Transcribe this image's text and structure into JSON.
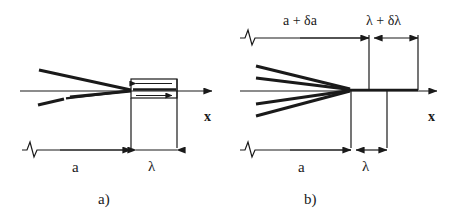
{
  "figure": {
    "background_color": "#ffffff",
    "ink_color": "#1a1a1a"
  },
  "panels": [
    {
      "id": "a",
      "caption": "a)",
      "axis_label": "x",
      "ray_count": 2,
      "has_box": true,
      "box_arrow_top_direction": "left",
      "box_arrow_bottom_direction": "right",
      "dimensions": [
        {
          "name": "distance-a",
          "label": "a",
          "position": "bottom"
        },
        {
          "name": "distance-lambda",
          "label": "λ",
          "position": "bottom"
        }
      ],
      "break_symbols": 1
    },
    {
      "id": "b",
      "caption": "b)",
      "axis_label": "x",
      "ray_count": 4,
      "has_box": false,
      "dimensions": [
        {
          "name": "distance-a-plus-delta-a",
          "label": "a + δa",
          "position": "top"
        },
        {
          "name": "distance-lambda-plus-delta-lambda",
          "label": "λ + δλ",
          "position": "top"
        },
        {
          "name": "distance-a",
          "label": "a",
          "position": "bottom"
        },
        {
          "name": "distance-lambda",
          "label": "λ",
          "position": "bottom"
        }
      ],
      "break_symbols": 2
    }
  ],
  "labels": {
    "panel_a_caption": "a)",
    "panel_b_caption": "b)",
    "panel_a_axis": "x",
    "panel_b_axis": "x",
    "panel_a_dim_a": "a",
    "panel_a_dim_lambda": "λ",
    "panel_b_dim_a_top": "a + δa",
    "panel_b_dim_lambda_top": "λ + δλ",
    "panel_b_dim_a_bottom": "a",
    "panel_b_dim_lambda_bottom": "λ"
  }
}
